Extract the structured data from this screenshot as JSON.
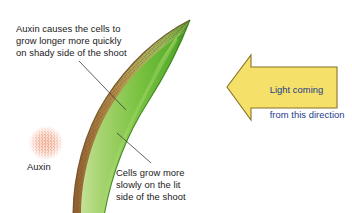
{
  "diagram": {
    "background_color": "#ffffff"
  },
  "annotations": {
    "shady_side_note": "Auxin causes the cells to\ngrow longer more quickly\non shady side of the shoot",
    "lit_side_note": "Cells grow more\nslowly on the lit\nside of the shoot",
    "auxin_label": "Auxin",
    "text_color": "#1a1a1a"
  },
  "light_arrow": {
    "line1": "Light coming",
    "line2": "from this direction",
    "full_text": "Light coming from this direction",
    "fill_color": "#f5e169",
    "stroke_color": "#8a7326",
    "text_color": "#1b3a8c",
    "direction": "left"
  },
  "shoot": {
    "green_light": "#bfe08a",
    "green_mid": "#79c242",
    "green_dark": "#4fa32a",
    "shady_band_color": "#a8743e",
    "stipple_color": "#6b3f1d",
    "outline_color": "#3d7a1f"
  },
  "auxin_blob": {
    "dot_color": "#e2582a",
    "halo_color": "#f4b79a",
    "center_x": 46,
    "center_y": 143,
    "radius": 16
  },
  "leader_lines": {
    "shady_leader": "line from shady-side note down-right to the brown band",
    "lit_leader": "line from lit-side note up-left to the green edge",
    "color": "#3a3a3a"
  },
  "icons": {
    "arrow_left_icon": "arrow-left-icon",
    "auxin_stipple_icon": "auxin-stipple-icon",
    "shoot_icon": "shoot-icon"
  }
}
